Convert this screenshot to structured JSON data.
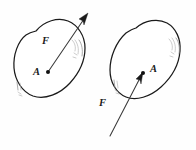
{
  "figure": {
    "background_color": "#fefefe",
    "outline_color": "#1a1a1a",
    "vector_color": "#3a3a3a",
    "hatch_color": "#8d8d8d",
    "panels": [
      {
        "id": "left-panel",
        "name": "force-inside-body",
        "body_label": "",
        "point_label": "A",
        "force_label": "F",
        "force_label_position": "inside-upper",
        "point_label_position": "left-of-dot",
        "arrow_direction": "up-right",
        "arrow_tail_at_point": true,
        "arrow_head_outside_body": true,
        "point_coords": {
          "x": 48,
          "y": 72
        },
        "arrow_tip_coords": {
          "x": 88,
          "y": 15
        },
        "hatch_groups": [
          "right-edge-arcs",
          "lower-left-ticks"
        ]
      },
      {
        "id": "right-panel",
        "name": "force-line-of-action-extended",
        "body_label": "",
        "point_label": "A",
        "force_label": "F",
        "force_label_position": "outside-lower-left",
        "point_label_position": "right-of-dot",
        "arrow_direction": "up-right",
        "arrow_tail_outside_body": true,
        "arrow_head_at_point": true,
        "point_coords": {
          "x": 143,
          "y": 73
        },
        "arrow_tail_coords": {
          "x": 110,
          "y": 136
        },
        "hatch_groups": [
          "right-edge-arcs",
          "left-edge-ticks"
        ]
      }
    ],
    "labels": {
      "force_symbol": "F",
      "point_symbol": "A"
    }
  }
}
